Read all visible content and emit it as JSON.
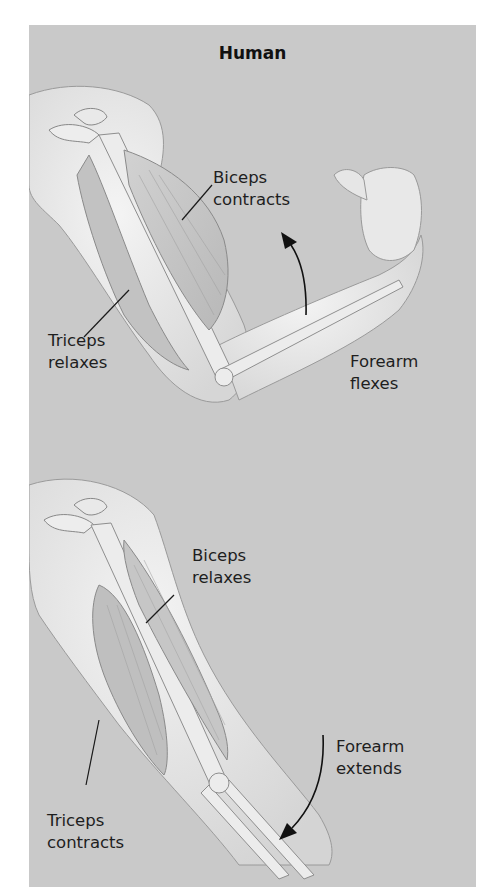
{
  "figure": {
    "title": "Human",
    "background_color": "#c9c9c9",
    "panels": [
      {
        "id": "flexion",
        "labels": {
          "biceps": [
            "Biceps",
            "contracts"
          ],
          "triceps": [
            "Triceps",
            "relaxes"
          ],
          "forearm": [
            "Forearm",
            "flexes"
          ]
        },
        "arrow_direction": "up"
      },
      {
        "id": "extension",
        "labels": {
          "biceps": [
            "Biceps",
            "relaxes"
          ],
          "triceps": [
            "Triceps",
            "contracts"
          ],
          "forearm": [
            "Forearm",
            "extends"
          ]
        },
        "arrow_direction": "down"
      }
    ]
  }
}
